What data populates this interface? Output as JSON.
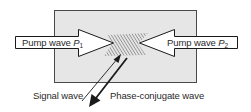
{
  "diagram": {
    "type": "four-wave-mixing phase conjugation",
    "medium": {
      "fill": "#e6e6e6",
      "stroke": "#4a4a4a"
    },
    "pump_left": {
      "label_text": "Pump wave ",
      "label_var": "P",
      "label_sub": "1",
      "direction": "right"
    },
    "pump_right": {
      "label_text": "Pump wave ",
      "label_var": "P",
      "label_sub": "2",
      "direction": "left"
    },
    "signal": {
      "label": "Signal wave",
      "direction": "into medium"
    },
    "conjugate": {
      "label": "Phase-conjugate wave",
      "direction": "out of medium"
    },
    "colors": {
      "line": "#1a1a1a",
      "arrow_fill": "#ffffff",
      "hatch": "#555555",
      "text": "#2a2a2a"
    }
  }
}
